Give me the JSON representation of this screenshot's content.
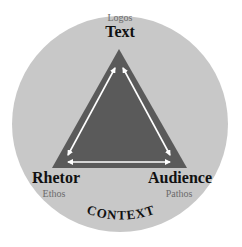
{
  "diagram": {
    "colors": {
      "circle": "#c8c8c8",
      "triangle": "#5a5a5a",
      "arrows": "#ffffff",
      "label": "#111111",
      "sublabel": "#6b6b6b"
    },
    "vertices": {
      "top": {
        "label": "Text",
        "appeal": "Logos"
      },
      "left": {
        "label": "Rhetor",
        "appeal": "Ethos"
      },
      "right": {
        "label": "Audience",
        "appeal": "Pathos"
      }
    },
    "context_label": "CONTEXT"
  }
}
